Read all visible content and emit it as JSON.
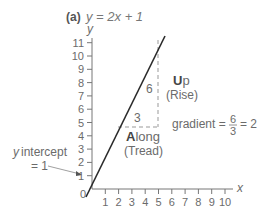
{
  "chart_data": {
    "type": "line",
    "panel_label": "(a)",
    "title": "y = 2x + 1",
    "xlabel": "x",
    "ylabel": "y",
    "xlim": [
      0,
      10
    ],
    "ylim": [
      0,
      11
    ],
    "x_ticks": [
      1,
      2,
      3,
      4,
      5,
      6,
      7,
      8,
      9,
      10
    ],
    "y_ticks": [
      1,
      2,
      3,
      4,
      5,
      6,
      7,
      8,
      9,
      10,
      11
    ],
    "origin_label": "0",
    "series": [
      {
        "name": "y = 2x + 1",
        "x": [
          -0.5,
          0,
          2,
          5,
          5.4
        ],
        "y": [
          0,
          1,
          5,
          11,
          11.8
        ]
      }
    ],
    "annotations": {
      "rise_value": "6",
      "run_value": "3",
      "up_bold": "U",
      "up_rest": "p",
      "rise_label": "(Rise)",
      "along_bold": "A",
      "along_rest": "long",
      "tread_label": "(Tread)",
      "gradient_text": "gradient =",
      "gradient_num": "6",
      "gradient_den": "3",
      "gradient_result": "= 2",
      "intercept_line1": "y intercept",
      "intercept_line2": "= 1"
    }
  }
}
